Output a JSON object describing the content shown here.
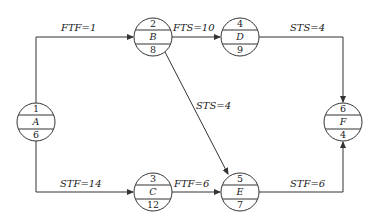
{
  "diagram": {
    "type": "single-code network (precedence diagram)",
    "nodes": [
      {
        "id": "A",
        "number": "1",
        "name": "A",
        "duration": "6",
        "cx": 36,
        "cy": 122
      },
      {
        "id": "B",
        "number": "2",
        "name": "B",
        "duration": "8",
        "cx": 153,
        "cy": 37
      },
      {
        "id": "C",
        "number": "3",
        "name": "C",
        "duration": "12",
        "cx": 153,
        "cy": 192
      },
      {
        "id": "D",
        "number": "4",
        "name": "D",
        "duration": "9",
        "cx": 240,
        "cy": 37
      },
      {
        "id": "E",
        "number": "5",
        "name": "E",
        "duration": "7",
        "cx": 240,
        "cy": 192
      },
      {
        "id": "F",
        "number": "6",
        "name": "F",
        "duration": "4",
        "cx": 343,
        "cy": 122
      }
    ],
    "edges": [
      {
        "from": "A",
        "to": "B",
        "relation": "FTF",
        "value": "1",
        "label": "FTF=1"
      },
      {
        "from": "B",
        "to": "D",
        "relation": "FTS",
        "value": "10",
        "label": "FTS=10"
      },
      {
        "from": "D",
        "to": "F",
        "relation": "STS",
        "value": "4",
        "label": "STS=4"
      },
      {
        "from": "B",
        "to": "E",
        "relation": "STS",
        "value": "4",
        "label": "STS=4"
      },
      {
        "from": "A",
        "to": "C",
        "relation": "STF",
        "value": "14",
        "label": "STF=14"
      },
      {
        "from": "C",
        "to": "E",
        "relation": "FTF",
        "value": "6",
        "label": "FTF=6"
      },
      {
        "from": "E",
        "to": "F",
        "relation": "STF",
        "value": "6",
        "label": "STF=6"
      }
    ]
  }
}
